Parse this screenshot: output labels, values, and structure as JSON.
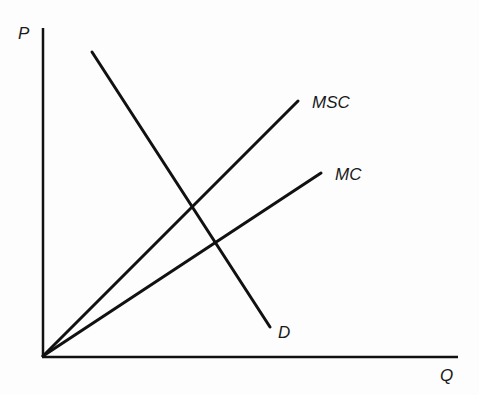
{
  "diagram": {
    "type": "economics-supply-demand",
    "axes": {
      "y_label": "P",
      "x_label": "Q"
    },
    "curves": [
      {
        "id": "msc",
        "label": "MSC",
        "description": "Marginal social cost",
        "from": [
          43,
          356
        ],
        "to": [
          298,
          101
        ]
      },
      {
        "id": "mc",
        "label": "MC",
        "description": "Marginal (private) cost",
        "from": [
          43,
          356
        ],
        "to": [
          321,
          173
        ]
      },
      {
        "id": "d",
        "label": "D",
        "description": "Demand",
        "from": [
          92,
          52
        ],
        "to": [
          270,
          327
        ]
      }
    ],
    "colors": {
      "line": "#111111",
      "text": "#1a1a1a",
      "background": "#fdfdfd"
    }
  }
}
